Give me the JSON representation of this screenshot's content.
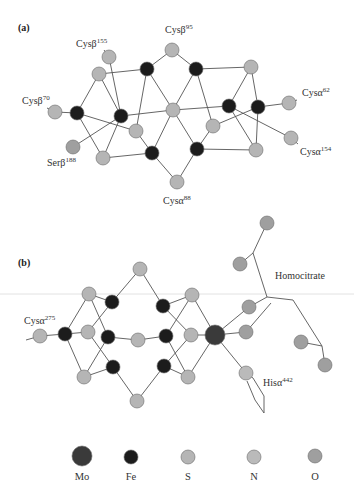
{
  "colors": {
    "Mo": "#3a3a3a",
    "Fe": "#1c1c1c",
    "S": "#b5b5b5",
    "N": "#bababa",
    "O": "#9f9f9f",
    "bond": "#555555"
  },
  "radii": {
    "Mo": 10,
    "Fe": 7,
    "S": 7,
    "N": 7,
    "O": 7
  },
  "panels": [
    {
      "id": "a",
      "label": "(a)",
      "label_pos": [
        18,
        31
      ],
      "atoms": [
        {
          "id": "S_cysB155",
          "el": "S",
          "x": 109,
          "y": 57
        },
        {
          "id": "S_tl",
          "el": "S",
          "x": 99,
          "y": 74
        },
        {
          "id": "Fe_t1",
          "el": "Fe",
          "x": 147,
          "y": 69
        },
        {
          "id": "S_cysB95",
          "el": "S",
          "x": 172,
          "y": 50
        },
        {
          "id": "Fe_t2",
          "el": "Fe",
          "x": 196,
          "y": 69
        },
        {
          "id": "S_tr",
          "el": "S",
          "x": 251,
          "y": 67
        },
        {
          "id": "S_cysB70",
          "el": "S",
          "x": 55,
          "y": 112
        },
        {
          "id": "Fe_l",
          "el": "Fe",
          "x": 77,
          "y": 113
        },
        {
          "id": "Fe_cl",
          "el": "Fe",
          "x": 121,
          "y": 116
        },
        {
          "id": "S_c",
          "el": "S",
          "x": 173,
          "y": 110
        },
        {
          "id": "Fe_r1",
          "el": "Fe",
          "x": 229,
          "y": 106
        },
        {
          "id": "Fe_r2",
          "el": "Fe",
          "x": 258,
          "y": 107
        },
        {
          "id": "S_cysA62",
          "el": "S",
          "x": 289,
          "y": 103
        },
        {
          "id": "S_ml",
          "el": "S",
          "x": 136,
          "y": 131
        },
        {
          "id": "S_mr",
          "el": "S",
          "x": 213,
          "y": 126
        },
        {
          "id": "O_serB188",
          "el": "O",
          "x": 73,
          "y": 147
        },
        {
          "id": "S_bl",
          "el": "S",
          "x": 103,
          "y": 158
        },
        {
          "id": "Fe_b1",
          "el": "Fe",
          "x": 152,
          "y": 153
        },
        {
          "id": "Fe_b2",
          "el": "Fe",
          "x": 197,
          "y": 149
        },
        {
          "id": "S_br",
          "el": "S",
          "x": 256,
          "y": 150
        },
        {
          "id": "S_cysA154",
          "el": "S",
          "x": 291,
          "y": 138
        },
        {
          "id": "S_cysA88",
          "el": "S",
          "x": 177,
          "y": 182
        }
      ],
      "bonds": [
        [
          "S_cysB155",
          "Fe_cl"
        ],
        [
          "S_tl",
          "Fe_t1"
        ],
        [
          "S_tl",
          "Fe_cl"
        ],
        [
          "S_tl",
          "Fe_l"
        ],
        [
          "Fe_t1",
          "S_cysB95"
        ],
        [
          "Fe_t1",
          "S_c"
        ],
        [
          "Fe_t1",
          "S_ml"
        ],
        [
          "S_cysB95",
          "Fe_t2"
        ],
        [
          "Fe_t2",
          "S_c"
        ],
        [
          "Fe_t2",
          "S_mr"
        ],
        [
          "Fe_t2",
          "S_tr"
        ],
        [
          "S_tr",
          "Fe_r1"
        ],
        [
          "S_tr",
          "Fe_r2"
        ],
        [
          "S_cysB70",
          "Fe_l"
        ],
        [
          "Fe_l",
          "S_ml"
        ],
        [
          "Fe_l",
          "S_bl"
        ],
        [
          "Fe_cl",
          "O_serB188"
        ],
        [
          "Fe_cl",
          "S_bl"
        ],
        [
          "Fe_cl",
          "S_c"
        ],
        [
          "S_c",
          "Fe_r1"
        ],
        [
          "S_c",
          "Fe_b1"
        ],
        [
          "S_c",
          "Fe_b2"
        ],
        [
          "Fe_r1",
          "S_cysA154"
        ],
        [
          "Fe_r1",
          "S_br"
        ],
        [
          "Fe_r2",
          "S_cysA62"
        ],
        [
          "Fe_r2",
          "S_mr"
        ],
        [
          "Fe_r2",
          "S_br"
        ],
        [
          "S_ml",
          "Fe_b1"
        ],
        [
          "S_bl",
          "Fe_b1"
        ],
        [
          "S_mr",
          "Fe_b2"
        ],
        [
          "Fe_b2",
          "S_br"
        ],
        [
          "Fe_b1",
          "S_cysA88"
        ],
        [
          "Fe_b2",
          "S_cysA88"
        ]
      ],
      "stubs": [
        [
          109,
          57,
          104,
          50
        ],
        [
          172,
          50,
          172,
          43
        ],
        [
          55,
          112,
          47,
          108
        ],
        [
          289,
          103,
          297,
          100
        ],
        [
          291,
          138,
          298,
          144
        ],
        [
          177,
          182,
          177,
          189
        ],
        [
          73,
          147,
          69,
          152
        ]
      ],
      "labels": [
        {
          "text": "Cysβ",
          "sup": "155",
          "x": 76,
          "y": 47
        },
        {
          "text": "Cysβ",
          "sup": "95",
          "x": 165,
          "y": 33
        },
        {
          "text": "Cysβ",
          "sup": "70",
          "x": 22,
          "y": 104
        },
        {
          "text": "Cysα",
          "sup": "62",
          "x": 302,
          "y": 96
        },
        {
          "text": "Cysα",
          "sup": "154",
          "x": 300,
          "y": 155
        },
        {
          "text": "Serβ",
          "sup": "188",
          "x": 47,
          "y": 166
        },
        {
          "text": "Cysα",
          "sup": "88",
          "x": 163,
          "y": 204
        }
      ]
    },
    {
      "id": "b",
      "label": "(b)",
      "label_pos": [
        18,
        266
      ],
      "atoms": [
        {
          "id": "S_cysA275",
          "el": "S",
          "x": 40,
          "y": 336
        },
        {
          "id": "Fe_l",
          "el": "Fe",
          "x": 65,
          "y": 334
        },
        {
          "id": "S_ul",
          "el": "S",
          "x": 89,
          "y": 294
        },
        {
          "id": "S_ml",
          "el": "S",
          "x": 88,
          "y": 332
        },
        {
          "id": "S_ll",
          "el": "S",
          "x": 84,
          "y": 377
        },
        {
          "id": "Fe_u1",
          "el": "Fe",
          "x": 112,
          "y": 302
        },
        {
          "id": "Fe_m1",
          "el": "Fe",
          "x": 108,
          "y": 337
        },
        {
          "id": "Fe_l1",
          "el": "Fe",
          "x": 113,
          "y": 367
        },
        {
          "id": "S_top",
          "el": "S",
          "x": 140,
          "y": 269
        },
        {
          "id": "S_c",
          "el": "S",
          "x": 138,
          "y": 340
        },
        {
          "id": "S_bot",
          "el": "S",
          "x": 137,
          "y": 401
        },
        {
          "id": "Fe_u2",
          "el": "Fe",
          "x": 163,
          "y": 306
        },
        {
          "id": "Fe_m2",
          "el": "Fe",
          "x": 166,
          "y": 336
        },
        {
          "id": "Fe_l2",
          "el": "Fe",
          "x": 164,
          "y": 366
        },
        {
          "id": "S_ur",
          "el": "S",
          "x": 192,
          "y": 295
        },
        {
          "id": "S_mr",
          "el": "S",
          "x": 191,
          "y": 335
        },
        {
          "id": "S_lr",
          "el": "S",
          "x": 188,
          "y": 377
        },
        {
          "id": "Mo",
          "el": "Mo",
          "x": 215,
          "y": 335
        },
        {
          "id": "O_hc1",
          "el": "O",
          "x": 249,
          "y": 307
        },
        {
          "id": "O_hc2",
          "el": "O",
          "x": 246,
          "y": 332
        },
        {
          "id": "N_his",
          "el": "N",
          "x": 246,
          "y": 373
        },
        {
          "id": "O_top",
          "el": "O",
          "x": 267,
          "y": 223
        },
        {
          "id": "O_up",
          "el": "O",
          "x": 240,
          "y": 264
        },
        {
          "id": "O_r1",
          "el": "O",
          "x": 301,
          "y": 342
        },
        {
          "id": "O_r2",
          "el": "O",
          "x": 325,
          "y": 365
        }
      ],
      "bonds": [
        [
          "S_cysA275",
          "Fe_l"
        ],
        [
          "Fe_l",
          "S_ul"
        ],
        [
          "Fe_l",
          "S_ml"
        ],
        [
          "Fe_l",
          "S_ll"
        ],
        [
          "S_ul",
          "Fe_u1"
        ],
        [
          "S_ul",
          "Fe_m1"
        ],
        [
          "S_ml",
          "Fe_u1"
        ],
        [
          "S_ml",
          "Fe_l1"
        ],
        [
          "S_ll",
          "Fe_m1"
        ],
        [
          "S_ll",
          "Fe_l1"
        ],
        [
          "Fe_u1",
          "S_top"
        ],
        [
          "Fe_m1",
          "S_c"
        ],
        [
          "Fe_l1",
          "S_bot"
        ],
        [
          "S_top",
          "Fe_u2"
        ],
        [
          "S_c",
          "Fe_m2"
        ],
        [
          "S_bot",
          "Fe_l2"
        ],
        [
          "Fe_u2",
          "S_ur"
        ],
        [
          "Fe_u2",
          "S_mr"
        ],
        [
          "Fe_m2",
          "S_ur"
        ],
        [
          "Fe_m2",
          "S_lr"
        ],
        [
          "Fe_l2",
          "S_mr"
        ],
        [
          "Fe_l2",
          "S_lr"
        ],
        [
          "S_ur",
          "Mo"
        ],
        [
          "S_mr",
          "Mo"
        ],
        [
          "S_lr",
          "Mo"
        ],
        [
          "Mo",
          "O_hc1"
        ],
        [
          "Mo",
          "O_hc2"
        ],
        [
          "Mo",
          "N_his"
        ]
      ],
      "polylines": [
        [
          [
            267,
            223
          ],
          [
            253,
            253
          ],
          [
            267,
            297
          ]
        ],
        [
          [
            253,
            253
          ],
          [
            240,
            264
          ]
        ],
        [
          [
            249,
            307
          ],
          [
            267,
            297
          ],
          [
            293,
            300
          ],
          [
            322,
            346
          ],
          [
            325,
            365
          ]
        ],
        [
          [
            301,
            342
          ],
          [
            322,
            346
          ]
        ],
        [
          [
            246,
            332
          ],
          [
            271,
            303
          ]
        ],
        [
          [
            40,
            336
          ],
          [
            26,
            340
          ]
        ],
        [
          [
            246,
            373
          ],
          [
            253,
            378
          ],
          [
            264,
            396
          ],
          [
            264,
            413
          ],
          [
            255,
            400
          ],
          [
            247,
            381
          ]
        ]
      ],
      "labels": [
        {
          "text": "Cysα",
          "sup": "275",
          "x": 24,
          "y": 324
        },
        {
          "text": "Homocitrate",
          "sup": "",
          "x": 275,
          "y": 279
        },
        {
          "text": "Hisα",
          "sup": "442",
          "x": 263,
          "y": 386
        }
      ]
    }
  ],
  "scanline_y": 294,
  "legend": [
    {
      "el": "Mo",
      "label": "Mo",
      "x": 82,
      "y": 456
    },
    {
      "el": "Fe",
      "label": "Fe",
      "x": 131,
      "y": 457
    },
    {
      "el": "S",
      "label": "S",
      "x": 188,
      "y": 457
    },
    {
      "el": "N",
      "label": "N",
      "x": 254,
      "y": 457
    },
    {
      "el": "O",
      "label": "O",
      "x": 315,
      "y": 456
    }
  ],
  "legend_label_y": 480
}
